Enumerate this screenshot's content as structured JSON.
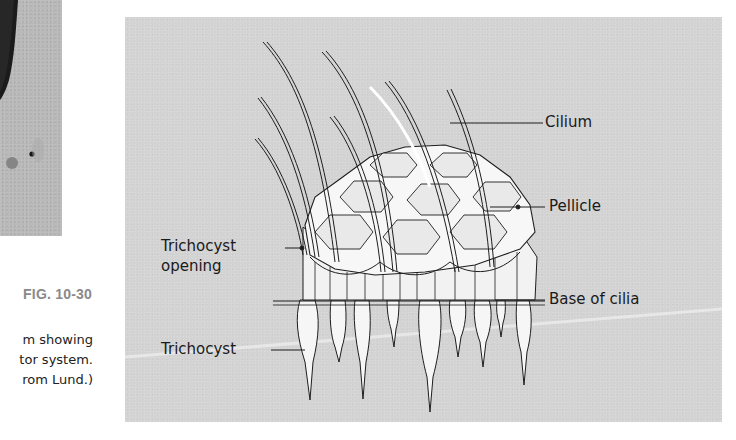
{
  "figure": {
    "number": "FIG. 10-30",
    "caption_lines": [
      "m showing",
      "tor system.",
      "rom Lund.)"
    ]
  },
  "diagram": {
    "labels": {
      "cilium": "Cilium",
      "pellicle": "Pellicle",
      "base_of_cilia": "Base of cilia",
      "trichocyst_opening_line1": "Trichocyst",
      "trichocyst_opening_line2": "opening",
      "trichocyst": "Trichocyst"
    },
    "colors": {
      "panel_background": "#d3d3d3",
      "structure_fill": "#f4f4f4",
      "outline": "#1e1e1e",
      "fig_number": "#8a8a8a"
    }
  }
}
